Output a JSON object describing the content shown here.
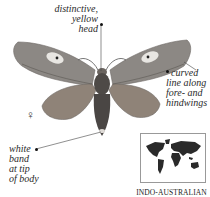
{
  "annotations": {
    "head": [
      "distinctive,",
      "yellow head"
    ],
    "line": [
      "curved",
      "line along",
      "fore- and",
      "hindwings"
    ],
    "band": [
      "white",
      "band",
      "at tip",
      "of body"
    ]
  },
  "sex_symbol": "♀",
  "map": {
    "region_label": "INDO-AUSTRALIAN"
  },
  "colors": {
    "moth_wing": "#8a8580",
    "moth_body": "#4a4644",
    "map_land": "#2a2a2a",
    "text": "#2a2a2a"
  }
}
